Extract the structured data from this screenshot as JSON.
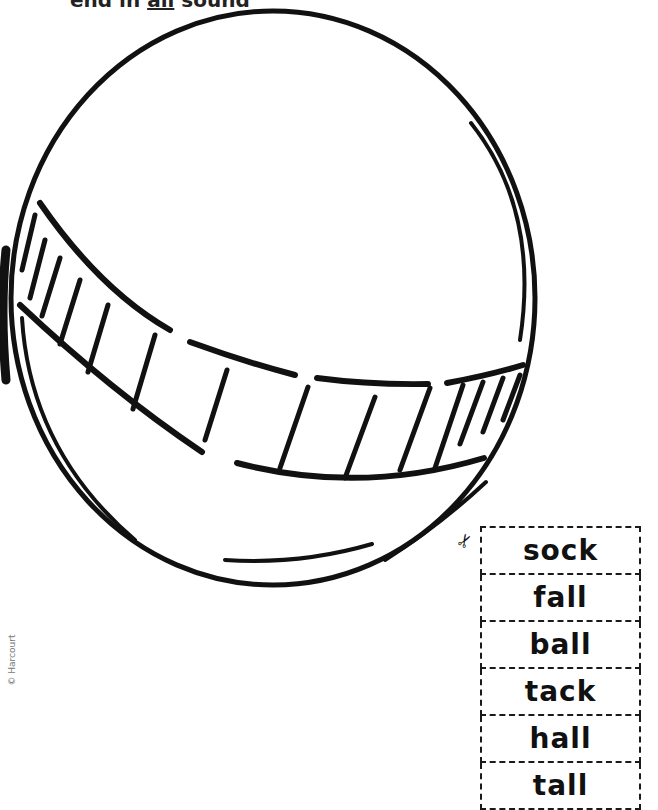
{
  "heading": {
    "prefix": "end in ",
    "underlined": "all",
    "suffix": " sound"
  },
  "copyright": "© Harcourt",
  "illustration": {
    "subject": "ball",
    "icon": "ball-illustration"
  },
  "cutout": {
    "scissors_icon": "scissors-icon",
    "words": [
      "sock",
      "fall",
      "ball",
      "tack",
      "hall",
      "tall"
    ]
  }
}
